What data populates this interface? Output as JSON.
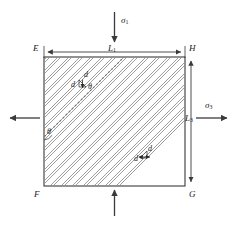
{
  "figure": {
    "type": "engineering-diagram",
    "colors": {
      "stroke": "#3a3a3a",
      "hatch": "#8a8a8a",
      "background": "#ffffff",
      "dotted": "#777777"
    },
    "geometry": {
      "square": {
        "x": 44,
        "y": 57,
        "width": 141,
        "height": 129
      },
      "joint_angle_deg": 45,
      "joint_spacing_px": 11
    }
  },
  "corners": {
    "top_left": "E",
    "top_right": "H",
    "bottom_left": "F",
    "bottom_right": "G"
  },
  "dimensions": {
    "horizontal": {
      "symbol": "L",
      "subscript": "1"
    },
    "vertical": {
      "symbol": "L",
      "subscript": "3"
    }
  },
  "stresses": {
    "top": {
      "symbol": "σ",
      "subscript": "1",
      "direction": "down"
    },
    "right": {
      "symbol": "σ",
      "subscript": "3",
      "direction": "right"
    },
    "bottom": {
      "symbol": "",
      "subscript": "",
      "direction": "up"
    },
    "left": {
      "symbol": "",
      "subscript": "",
      "direction": "left"
    }
  },
  "annotations": {
    "spacing_upper": {
      "d_top": "d",
      "d_left": "d",
      "theta": "θ"
    },
    "spacing_lower": {
      "d_top": "d",
      "d_left": "d"
    },
    "edge_angle": {
      "theta": "θ"
    }
  },
  "icons": {
    "arrow_down": "arrow-down-icon",
    "arrow_up": "arrow-up-icon",
    "arrow_left": "arrow-left-icon",
    "arrow_right": "arrow-right-icon",
    "dimension_arrow": "dimension-arrow-icon"
  }
}
